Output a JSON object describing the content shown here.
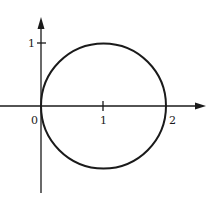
{
  "diagram": {
    "type": "circle-on-coordinate-axes",
    "colors": {
      "stroke": "#1a1a1a",
      "background": "#ffffff"
    },
    "axes": {
      "x_axis": {
        "arrow": true
      },
      "y_axis": {
        "arrow": true
      }
    },
    "circle": {
      "center": [
        1,
        0
      ],
      "radius": 1
    },
    "labels": {
      "origin": "0",
      "x_tick_1": "1",
      "x_tick_2": "2",
      "y_tick_1": "1"
    }
  }
}
